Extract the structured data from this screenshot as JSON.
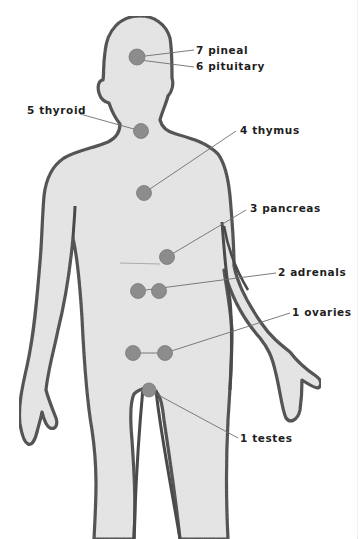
{
  "diagram": {
    "colors": {
      "body_fill": "#e6e6e6",
      "body_outline": "#4a4a4a",
      "gland_dot": "#8c8c8c",
      "leader_line": "#6e6e6e",
      "label_text": "#1e1e1e"
    },
    "glands": [
      {
        "id": "pineal",
        "number": "7",
        "name": "pineal",
        "label": "7 pineal",
        "dots": [
          [
            137,
            57
          ]
        ],
        "label_pos": [
          196,
          44
        ]
      },
      {
        "id": "pituitary",
        "number": "6",
        "name": "pituitary",
        "label": "6 pituitary",
        "dots": [
          [
            137,
            57
          ]
        ],
        "label_pos": [
          196,
          60
        ]
      },
      {
        "id": "thyroid",
        "number": "5",
        "name": "thyroid",
        "label": "5 thyroid",
        "dots": [
          [
            141,
            131
          ]
        ],
        "label_pos": [
          27,
          104
        ]
      },
      {
        "id": "thymus",
        "number": "4",
        "name": "thymus",
        "label": "4 thymus",
        "dots": [
          [
            144,
            193
          ]
        ],
        "label_pos": [
          240,
          124
        ]
      },
      {
        "id": "pancreas",
        "number": "3",
        "name": "pancreas",
        "label": "3 pancreas",
        "dots": [
          [
            167,
            257
          ]
        ],
        "label_pos": [
          250,
          202
        ]
      },
      {
        "id": "adrenals",
        "number": "2",
        "name": "adrenals",
        "label": "2 adrenals",
        "dots": [
          [
            138,
            291
          ],
          [
            159,
            291
          ]
        ],
        "label_pos": [
          278,
          266
        ]
      },
      {
        "id": "ovaries",
        "number": "1",
        "name": "ovaries",
        "label": "1 ovaries",
        "dots": [
          [
            133,
            353
          ],
          [
            165,
            353
          ]
        ],
        "label_pos": [
          292,
          306
        ]
      },
      {
        "id": "testes",
        "number": "1",
        "name": "testes",
        "label": "1 testes",
        "dots": [
          [
            149,
            390
          ]
        ],
        "label_pos": [
          240,
          432
        ]
      }
    ]
  }
}
